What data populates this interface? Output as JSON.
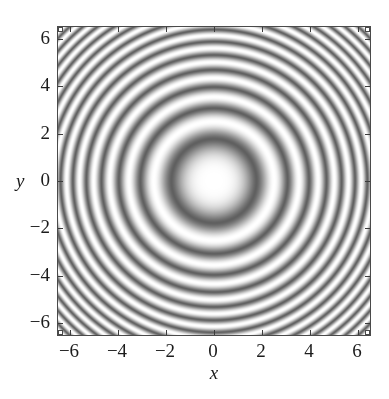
{
  "figure": {
    "background": "#ffffff",
    "frame_color": "#4a4a4a"
  },
  "axes": {
    "x_label": "x",
    "y_label": "y",
    "x_ticks": [
      -6,
      -4,
      -2,
      0,
      2,
      4,
      6
    ],
    "y_ticks": [
      -6,
      -4,
      -2,
      0,
      2,
      4,
      6
    ],
    "x_tick_labels": [
      "−6",
      "−4",
      "−2",
      "0",
      "2",
      "4",
      "6"
    ],
    "y_tick_labels": [
      "6",
      "4",
      "2",
      "0",
      "−2",
      "−4",
      "−6"
    ]
  },
  "chart_data": {
    "type": "heatmap",
    "title": "",
    "subtitle": "",
    "xlabel": "x",
    "ylabel": "y",
    "xlim": [
      -6.5,
      6.5
    ],
    "ylim": [
      -6.5,
      6.5
    ],
    "xticks": [
      -6,
      -4,
      -2,
      0,
      2,
      4,
      6
    ],
    "yticks": [
      -6,
      -4,
      -2,
      0,
      2,
      4,
      6
    ],
    "xticklabels": [
      "−6",
      "−4",
      "−2",
      "0",
      "2",
      "4",
      "6"
    ],
    "yticklabels": [
      "−6",
      "−4",
      "−2",
      "0",
      "2",
      "4",
      "6"
    ],
    "grid": false,
    "legend": null,
    "colormap": "grayscale",
    "colormap_low": "#5f5f5f",
    "colormap_high": "#ffffff",
    "radial_symmetric": true,
    "center": [
      0,
      0
    ],
    "function": "cos(r^2)",
    "zlim": [
      -1,
      1
    ],
    "ring_bright_radii": [
      0.0,
      2.51,
      3.54,
      4.34,
      5.01,
      5.6,
      6.14,
      6.64,
      7.09,
      7.52,
      7.93,
      8.32,
      8.69,
      9.05
    ],
    "ring_dark_radii": [
      1.77,
      3.07,
      3.96,
      4.69,
      5.32,
      5.88,
      6.39,
      6.87,
      7.31,
      7.73,
      8.13,
      8.51,
      8.87
    ],
    "samples_radial": [
      {
        "r": 0.0,
        "z": 1.0
      },
      {
        "r": 0.5,
        "z": 0.97
      },
      {
        "r": 1.0,
        "z": 0.54
      },
      {
        "r": 1.5,
        "z": -0.63
      },
      {
        "r": 2.0,
        "z": -0.65
      },
      {
        "r": 2.5,
        "z": 0.97
      },
      {
        "r": 3.0,
        "z": -0.91
      },
      {
        "r": 3.5,
        "z": 0.99
      },
      {
        "r": 4.0,
        "z": -0.96
      },
      {
        "r": 4.5,
        "z": 0.14
      },
      {
        "r": 5.0,
        "z": 1.0
      },
      {
        "r": 5.5,
        "z": -0.77
      },
      {
        "r": 6.0,
        "z": -0.13
      },
      {
        "r": 6.5,
        "z": 0.92
      },
      {
        "r": 7.0,
        "z": 0.74
      },
      {
        "r": 7.5,
        "z": -0.91
      },
      {
        "r": 8.0,
        "z": -0.39
      },
      {
        "r": 8.5,
        "z": 0.98
      },
      {
        "r": 9.0,
        "z": -0.32
      }
    ]
  }
}
